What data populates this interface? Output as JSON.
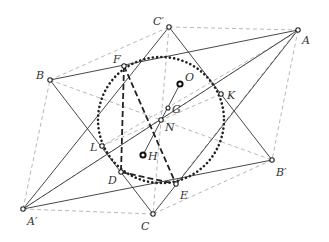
{
  "diagram": {
    "points": {
      "A": {
        "label": "A",
        "x": 298,
        "y": 30
      },
      "B": {
        "label": "B",
        "x": 50,
        "y": 80
      },
      "C": {
        "label": "C",
        "x": 153,
        "y": 214
      },
      "Ap": {
        "label": "A′",
        "x": 23,
        "y": 209
      },
      "Bp": {
        "label": "B′",
        "x": 272,
        "y": 160
      },
      "Cp": {
        "label": "C′",
        "x": 169,
        "y": 27
      },
      "F": {
        "label": "F",
        "x": 124,
        "y": 66
      },
      "K": {
        "label": "K",
        "x": 221,
        "y": 94
      },
      "L": {
        "label": "L",
        "x": 102,
        "y": 146
      },
      "D": {
        "label": "D",
        "x": 121,
        "y": 172
      },
      "E": {
        "label": "E",
        "x": 176,
        "y": 184
      },
      "O": {
        "label": "O",
        "x": 180,
        "y": 84
      },
      "G": {
        "label": "G",
        "x": 168,
        "y": 108
      },
      "N": {
        "label": "N",
        "x": 161,
        "y": 120
      },
      "H": {
        "label": "H",
        "x": 143,
        "y": 155
      }
    },
    "circle": {
      "name": "nine-point-circle",
      "center": "N",
      "radius": 63,
      "style": "dotted"
    }
  }
}
